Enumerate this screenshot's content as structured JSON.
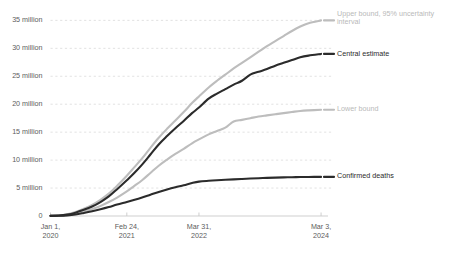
{
  "chart_data": {
    "type": "line",
    "title": "",
    "subtitle": "",
    "xlabel": "",
    "ylabel": "",
    "grid": "horizontal-dashed",
    "legend_position": "inline-right",
    "ylim": [
      0,
      36.5
    ],
    "xlim": [
      0,
      100
    ],
    "y_ticks": [
      0,
      5,
      10,
      15,
      20,
      25,
      30,
      35
    ],
    "y_tick_labels": [
      "0",
      "5 million",
      "10 million",
      "15 million",
      "20 million",
      "25 million",
      "30 million",
      "35 million"
    ],
    "x_ticks": [
      0,
      27.5,
      53.5,
      97.5
    ],
    "x_tick_labels": [
      {
        "line1": "Jan 1,",
        "line2": "2020"
      },
      {
        "line1": "Feb 24,",
        "line2": "2021"
      },
      {
        "line1": "Mar 31,",
        "line2": "2022"
      },
      {
        "line1": "Mar 3,",
        "line2": "2024"
      }
    ],
    "units": "million deaths (cumulative)",
    "series": [
      {
        "name": "Upper bound, 95% uncertainty interval",
        "label_line1": "Upper bound, 95% uncertainty",
        "label_line2": "interval",
        "color": "#bdbdbd",
        "style": "light",
        "end_value": 35.0,
        "x": [
          0,
          3,
          6,
          9,
          12,
          15,
          18,
          21,
          24,
          27.5,
          30,
          33,
          36,
          39,
          42,
          45,
          48,
          51,
          53.5,
          57,
          60,
          63,
          66,
          69,
          72,
          75,
          78,
          81,
          84,
          87,
          90,
          93,
          97.5
        ],
        "values": [
          0.05,
          0.1,
          0.3,
          0.7,
          1.3,
          2.0,
          2.9,
          4.0,
          5.4,
          7.2,
          8.6,
          10.3,
          12.2,
          14.0,
          15.6,
          17.1,
          18.6,
          20.2,
          21.4,
          23.0,
          24.2,
          25.3,
          26.4,
          27.4,
          28.4,
          29.4,
          30.4,
          31.3,
          32.2,
          33.1,
          33.9,
          34.5,
          35.0
        ]
      },
      {
        "name": "Central estimate",
        "label_line1": "Central estimate",
        "label_line2": "",
        "color": "#2b2b2b",
        "style": "dark",
        "end_value": 29.0,
        "x": [
          0,
          3,
          6,
          9,
          12,
          15,
          18,
          21,
          24,
          27.5,
          30,
          33,
          36,
          39,
          42,
          45,
          48,
          51,
          53.5,
          57,
          60,
          63,
          66,
          69,
          72,
          75,
          78,
          81,
          84,
          87,
          90,
          93,
          97.5
        ],
        "values": [
          0.04,
          0.08,
          0.25,
          0.6,
          1.1,
          1.7,
          2.5,
          3.5,
          4.8,
          6.4,
          7.6,
          9.2,
          11.0,
          12.8,
          14.3,
          15.7,
          17.0,
          18.4,
          19.4,
          21.0,
          21.9,
          22.7,
          23.5,
          24.2,
          25.3,
          25.8,
          26.3,
          26.9,
          27.4,
          27.9,
          28.4,
          28.7,
          29.0
        ]
      },
      {
        "name": "Lower bound",
        "label_line1": "Lower bound",
        "label_line2": "",
        "color": "#bdbdbd",
        "style": "light",
        "end_value": 19.0,
        "x": [
          0,
          3,
          6,
          9,
          12,
          15,
          18,
          21,
          24,
          27.5,
          30,
          33,
          36,
          39,
          42,
          45,
          48,
          51,
          53.5,
          57,
          60,
          63,
          66,
          69,
          72,
          75,
          78,
          81,
          84,
          87,
          90,
          93,
          97.5
        ],
        "values": [
          0.03,
          0.06,
          0.18,
          0.45,
          0.8,
          1.25,
          1.8,
          2.5,
          3.3,
          4.4,
          5.3,
          6.4,
          7.7,
          9.0,
          10.1,
          11.1,
          12.0,
          13.0,
          13.7,
          14.6,
          15.2,
          15.8,
          16.9,
          17.2,
          17.5,
          17.8,
          18.0,
          18.2,
          18.4,
          18.6,
          18.8,
          18.9,
          19.0
        ]
      },
      {
        "name": "Confirmed deaths",
        "label_line1": "Confirmed deaths",
        "label_line2": "",
        "color": "#2b2b2b",
        "style": "dark",
        "end_value": 7.0,
        "x": [
          0,
          3,
          6,
          9,
          12,
          15,
          18,
          21,
          24,
          27.5,
          30,
          33,
          36,
          39,
          42,
          45,
          48,
          51,
          53.5,
          57,
          60,
          63,
          66,
          69,
          72,
          75,
          78,
          81,
          84,
          87,
          90,
          93,
          97.5
        ],
        "values": [
          0.02,
          0.04,
          0.12,
          0.28,
          0.55,
          0.85,
          1.2,
          1.6,
          2.05,
          2.5,
          2.85,
          3.3,
          3.8,
          4.3,
          4.75,
          5.15,
          5.5,
          5.9,
          6.15,
          6.3,
          6.4,
          6.48,
          6.55,
          6.62,
          6.7,
          6.76,
          6.82,
          6.87,
          6.91,
          6.94,
          6.97,
          6.99,
          7.0
        ]
      }
    ]
  },
  "annotations": {
    "upper_bound_label_l1": "Upper bound, 95% uncertainty",
    "upper_bound_label_l2": "interval",
    "central_label": "Central estimate",
    "lower_label": "Lower bound",
    "confirmed_label": "Confirmed deaths"
  }
}
